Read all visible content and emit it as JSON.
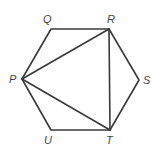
{
  "figure": {
    "stroke_color": "#3a3a3a",
    "label_color": "#444444",
    "vertices": [
      {
        "name": "P",
        "x": 22,
        "y": 79
      },
      {
        "name": "Q",
        "x": 51,
        "y": 29
      },
      {
        "name": "R",
        "x": 109,
        "y": 29
      },
      {
        "name": "S",
        "x": 139,
        "y": 80
      },
      {
        "name": "T",
        "x": 110,
        "y": 130
      },
      {
        "name": "U",
        "x": 51,
        "y": 130
      }
    ],
    "labels": {
      "P": "P",
      "Q": "Q",
      "R": "R",
      "S": "S",
      "T": "T",
      "U": "U"
    },
    "segments": [
      [
        "P",
        "Q"
      ],
      [
        "Q",
        "R"
      ],
      [
        "R",
        "S"
      ],
      [
        "S",
        "T"
      ],
      [
        "T",
        "U"
      ],
      [
        "U",
        "P"
      ],
      [
        "P",
        "R"
      ],
      [
        "P",
        "T"
      ],
      [
        "R",
        "T"
      ]
    ]
  }
}
